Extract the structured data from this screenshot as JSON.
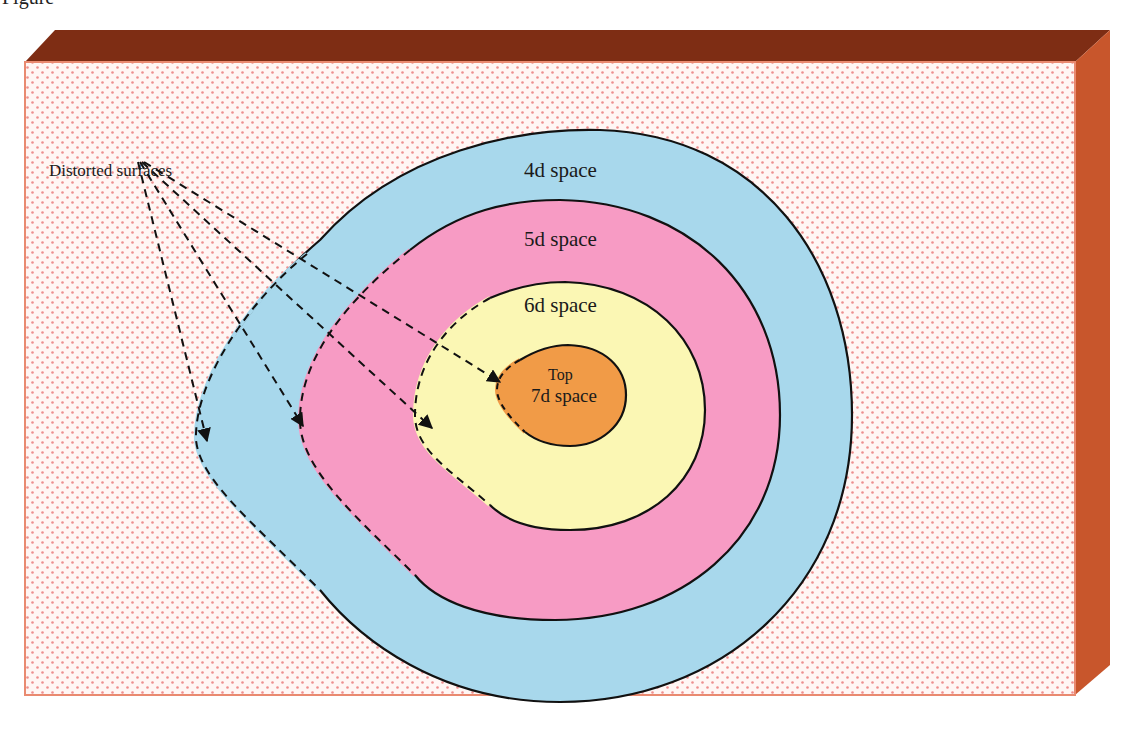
{
  "figure": {
    "title_cropped": "Figure",
    "colors": {
      "box_top": "#7e2d14",
      "box_side": "#c8562c",
      "box_face_bg": "#fff6f4",
      "box_face_dot": "#ee8e8e",
      "box_border": "#e98a70",
      "space_4d": "#a8d8ec",
      "space_5d": "#f79bc4",
      "space_6d": "#fbf7b4",
      "space_7d": "#f19b47",
      "outline": "#111111"
    }
  },
  "labels": {
    "distorted_surfaces": "Distorted surfaces",
    "space_4d": "4d space",
    "space_5d": "5d space",
    "space_6d": "6d space",
    "space_7d_line1": "Top",
    "space_7d_line2": "7d space"
  },
  "arrows": [
    {
      "target": "4d space boundary",
      "from": [
        138,
        160
      ],
      "to": [
        207,
        441
      ]
    },
    {
      "target": "5d space boundary",
      "from": [
        140,
        160
      ],
      "to": [
        303,
        426
      ]
    },
    {
      "target": "6d space boundary",
      "from": [
        142,
        160
      ],
      "to": [
        432,
        428
      ]
    },
    {
      "target": "7d space boundary",
      "from": [
        144,
        160
      ],
      "to": [
        500,
        382
      ]
    }
  ]
}
